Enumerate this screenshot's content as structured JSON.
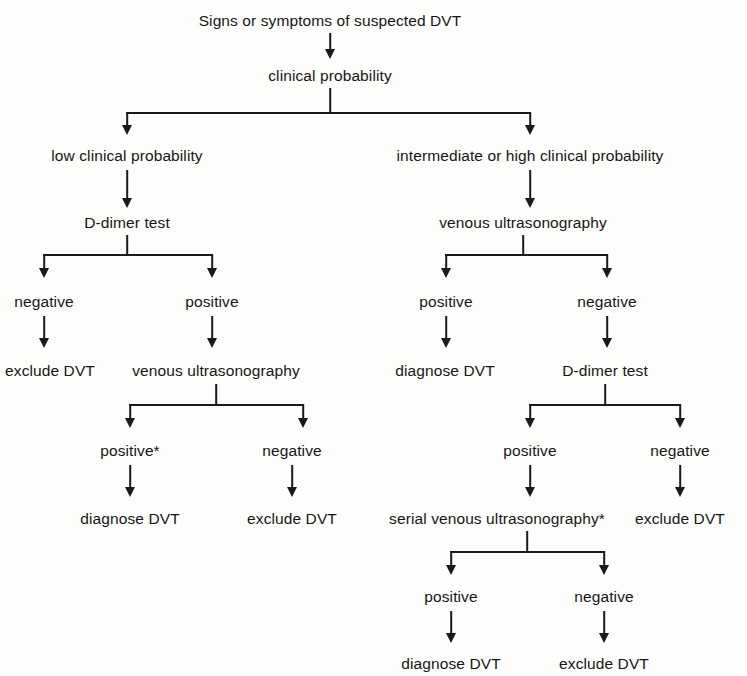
{
  "diagram": {
    "background_color": "#fdfdfc",
    "line_color": "#1a1a1a",
    "text_color": "#161616",
    "nodes": {
      "root": "Signs or symptoms of suspected DVT",
      "clinical_probability": "clinical probability",
      "low_probability": "low clinical probability",
      "high_probability": "intermediate or high clinical probability",
      "left_ddimer": "D-dimer test",
      "left_ddimer_negative": "negative",
      "left_ddimer_positive": "positive",
      "left_exclude_1": "exclude DVT",
      "left_us": "venous ultrasonography",
      "left_us_positive": "positive*",
      "left_us_negative": "negative",
      "left_diagnose": "diagnose DVT",
      "left_exclude_2": "exclude DVT",
      "right_us": "venous ultrasonography",
      "right_us_positive": "positive",
      "right_us_negative": "negative",
      "right_diagnose_1": "diagnose DVT",
      "right_ddimer": "D-dimer test",
      "right_ddimer_positive": "positive",
      "right_ddimer_negative": "negative",
      "right_exclude_1": "exclude DVT",
      "right_serial_us": "serial venous ultrasonography*",
      "right_serial_positive": "positive",
      "right_serial_negative": "negative",
      "right_diagnose_2": "diagnose DVT",
      "right_exclude_2": "exclude DVT"
    }
  }
}
